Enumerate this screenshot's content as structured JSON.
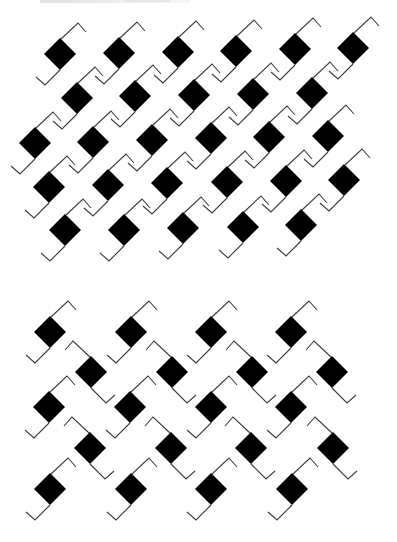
{
  "figure": {
    "colors": {
      "diamond": "#000000",
      "stroke": "#3c3c3c",
      "background": "#ffffff"
    },
    "unit": {
      "half_diagonal": 16,
      "normal_top_hook": [
        [
          1,
          -15
        ],
        [
          18,
          -31
        ],
        [
          26,
          -22
        ]
      ],
      "normal_bottom_hook": [
        [
          0,
          16
        ],
        [
          -15,
          31
        ],
        [
          -24,
          23
        ]
      ]
    },
    "patterns": [
      {
        "name": "upper-pattern",
        "arrangement": "diagonal-staggered",
        "rows": [
          {
            "orientation": "normal",
            "centers": [
              [
                60,
                54
              ],
              [
                119,
                53
              ],
              [
                178,
                52
              ],
              [
                236,
                51
              ],
              [
                295,
                49
              ],
              [
                353,
                48
              ]
            ]
          },
          {
            "orientation": "normal",
            "centers": [
              [
                77,
                98
              ],
              [
                135,
                96
              ],
              [
                194,
                95
              ],
              [
                253,
                94
              ],
              [
                312,
                93
              ]
            ]
          },
          {
            "orientation": "normal",
            "centers": [
              [
                35,
                143
              ],
              [
                93,
                142
              ],
              [
                152,
                140
              ],
              [
                211,
                138
              ],
              [
                269,
                137
              ],
              [
                328,
                136
              ]
            ]
          },
          {
            "orientation": "normal",
            "centers": [
              [
                49,
                187
              ],
              [
                108,
                185
              ],
              [
                167,
                183
              ],
              [
                227,
                182
              ],
              [
                286,
                181
              ],
              [
                344,
                180
              ]
            ]
          },
          {
            "orientation": "normal",
            "centers": [
              [
                65,
                230
              ],
              [
                124,
                230
              ],
              [
                183,
                228
              ],
              [
                243,
                227
              ],
              [
                301,
                225
              ]
            ]
          }
        ]
      },
      {
        "name": "lower-pattern",
        "arrangement": "alternating-mirrored-rows",
        "rows": [
          {
            "orientation": "normal",
            "centers": [
              [
                50,
                332
              ],
              [
                131,
                332
              ],
              [
                211,
                332
              ],
              [
                291,
                332
              ]
            ]
          },
          {
            "orientation": "mirrored",
            "centers": [
              [
                91,
                372
              ],
              [
                172,
                372
              ],
              [
                252,
                372
              ],
              [
                332,
                372
              ]
            ]
          },
          {
            "orientation": "normal",
            "centers": [
              [
                49,
                407
              ],
              [
                130,
                407
              ],
              [
                211,
                407
              ],
              [
                291,
                407
              ]
            ]
          },
          {
            "orientation": "mirrored",
            "centers": [
              [
                90,
                448
              ],
              [
                171,
                448
              ],
              [
                251,
                448
              ],
              [
                333,
                448
              ]
            ]
          },
          {
            "orientation": "normal",
            "centers": [
              [
                50,
                489
              ],
              [
                131,
                489
              ],
              [
                211,
                489
              ],
              [
                292,
                489
              ]
            ]
          }
        ]
      }
    ]
  }
}
